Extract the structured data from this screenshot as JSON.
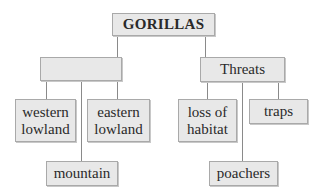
{
  "diagram": {
    "type": "concept-map",
    "root": {
      "label": "GORILLAS"
    },
    "branches": [
      {
        "label": "",
        "children": [
          {
            "label": "western\nlowland"
          },
          {
            "label": "eastern\nlowland"
          },
          {
            "label": "mountain"
          }
        ]
      },
      {
        "label": "Threats",
        "children": [
          {
            "label": "loss of\nhabitat"
          },
          {
            "label": "traps"
          },
          {
            "label": "poachers"
          }
        ]
      }
    ]
  },
  "colors": {
    "box_fill": "#e8e8e8",
    "box_border": "#a9a9a9",
    "connector": "#8a8a8a",
    "text": "#2a2a2a"
  }
}
